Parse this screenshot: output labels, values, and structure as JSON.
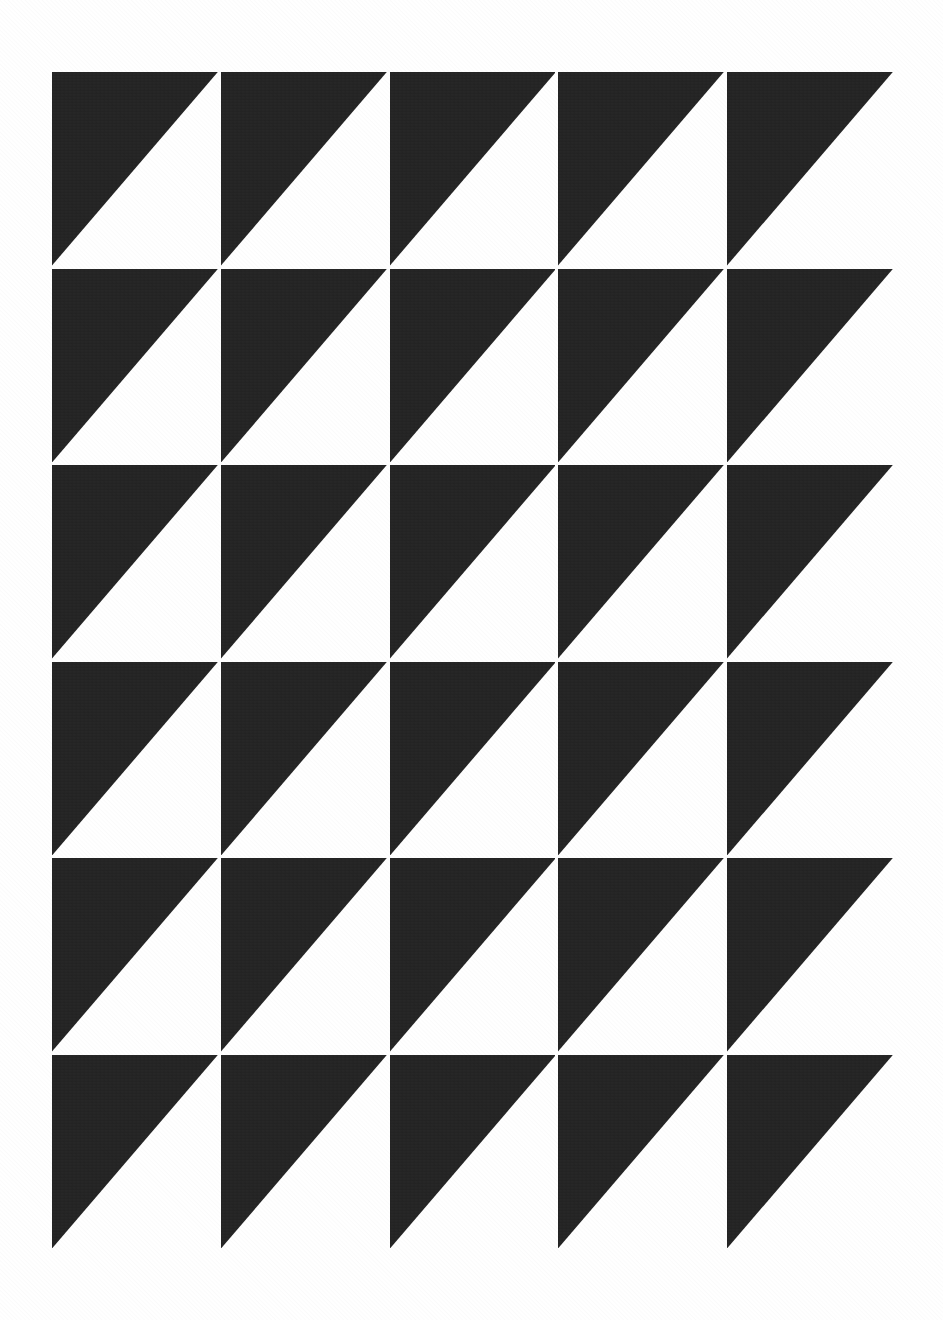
{
  "artwork": {
    "title": "Half-Square Triangle Tiling",
    "description": "Monochrome grid of right triangles, each tile filled in the upper-left half",
    "background_color": "#ffffff",
    "ink_color": "#242424",
    "canvas": {
      "width": 943,
      "height": 1320
    },
    "grid": {
      "columns": 5,
      "rows": 6,
      "tile_count": 30,
      "origin_x": 52,
      "origin_y": 72,
      "block_width": 841,
      "block_height": 1176,
      "tile_width": 167,
      "tile_height": 194,
      "gap": 3
    },
    "tile_motif": {
      "shape": "right-triangle",
      "filled_half": "upper-left",
      "hypotenuse": "top-right to bottom-left",
      "polygon_points": "0,0 100,0 0,100"
    },
    "tiles": [
      {
        "row": 1,
        "col": 1,
        "orientation": "upper-left"
      },
      {
        "row": 1,
        "col": 2,
        "orientation": "upper-left"
      },
      {
        "row": 1,
        "col": 3,
        "orientation": "upper-left"
      },
      {
        "row": 1,
        "col": 4,
        "orientation": "upper-left"
      },
      {
        "row": 1,
        "col": 5,
        "orientation": "upper-left"
      },
      {
        "row": 2,
        "col": 1,
        "orientation": "upper-left"
      },
      {
        "row": 2,
        "col": 2,
        "orientation": "upper-left"
      },
      {
        "row": 2,
        "col": 3,
        "orientation": "upper-left"
      },
      {
        "row": 2,
        "col": 4,
        "orientation": "upper-left"
      },
      {
        "row": 2,
        "col": 5,
        "orientation": "upper-left"
      },
      {
        "row": 3,
        "col": 1,
        "orientation": "upper-left"
      },
      {
        "row": 3,
        "col": 2,
        "orientation": "upper-left"
      },
      {
        "row": 3,
        "col": 3,
        "orientation": "upper-left"
      },
      {
        "row": 3,
        "col": 4,
        "orientation": "upper-left"
      },
      {
        "row": 3,
        "col": 5,
        "orientation": "upper-left"
      },
      {
        "row": 4,
        "col": 1,
        "orientation": "upper-left"
      },
      {
        "row": 4,
        "col": 2,
        "orientation": "upper-left"
      },
      {
        "row": 4,
        "col": 3,
        "orientation": "upper-left"
      },
      {
        "row": 4,
        "col": 4,
        "orientation": "upper-left"
      },
      {
        "row": 4,
        "col": 5,
        "orientation": "upper-left"
      },
      {
        "row": 5,
        "col": 1,
        "orientation": "upper-left"
      },
      {
        "row": 5,
        "col": 2,
        "orientation": "upper-left"
      },
      {
        "row": 5,
        "col": 3,
        "orientation": "upper-left"
      },
      {
        "row": 5,
        "col": 4,
        "orientation": "upper-left"
      },
      {
        "row": 5,
        "col": 5,
        "orientation": "upper-left"
      },
      {
        "row": 6,
        "col": 1,
        "orientation": "upper-left"
      },
      {
        "row": 6,
        "col": 2,
        "orientation": "upper-left"
      },
      {
        "row": 6,
        "col": 3,
        "orientation": "upper-left"
      },
      {
        "row": 6,
        "col": 4,
        "orientation": "upper-left"
      },
      {
        "row": 6,
        "col": 5,
        "orientation": "upper-left"
      }
    ]
  }
}
